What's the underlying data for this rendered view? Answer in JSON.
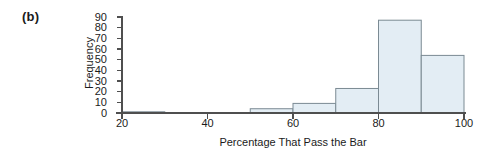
{
  "panel": {
    "label": "(b)"
  },
  "chart_data": {
    "type": "bar",
    "title": "",
    "subtitle": "",
    "xlabel": "Percentage That Pass the Bar",
    "ylabel": "Frequency",
    "categories": [
      "20-30",
      "30-40",
      "40-50",
      "50-60",
      "60-70",
      "70-80",
      "80-90",
      "90-100"
    ],
    "bin_edges": [
      20,
      30,
      40,
      50,
      60,
      70,
      80,
      90,
      100
    ],
    "values": [
      1,
      0,
      0,
      4,
      9,
      23,
      87,
      54
    ],
    "xlim": [
      20,
      100
    ],
    "ylim": [
      0,
      90
    ],
    "xticks": [
      20,
      40,
      60,
      80,
      100
    ],
    "xtick_labels": [
      "20",
      "40",
      "60",
      "80",
      "100"
    ],
    "yticks": [
      0,
      10,
      20,
      30,
      40,
      50,
      60,
      70,
      80,
      90
    ],
    "ytick_labels": [
      "0",
      "10",
      "20",
      "30",
      "40",
      "50",
      "60",
      "70",
      "80",
      "90"
    ],
    "grid": false,
    "legend": null,
    "bar_fill_color": "#e3edf4",
    "bar_edge_color": "#7b8a93",
    "axis_color": "#4f4f4f",
    "text_color": "#1b1b1b",
    "background_color": "#ffffff"
  }
}
